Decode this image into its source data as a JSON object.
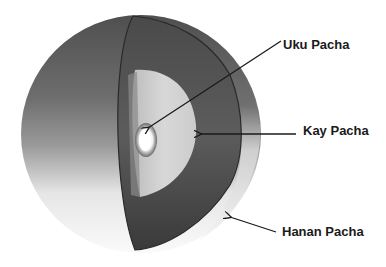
{
  "diagram": {
    "labels": [
      {
        "id": "uku",
        "text": "Uku Pacha",
        "points_to": "innermost core"
      },
      {
        "id": "kay",
        "text": "Kay Pacha",
        "points_to": "middle light layer"
      },
      {
        "id": "hanan",
        "text": "Hanan Pacha",
        "points_to": "outer sphere surface"
      }
    ]
  },
  "colors": {
    "background": "#ffffff",
    "text": "#1a1a1a",
    "arrow": "#1a1a1a",
    "outer_shell_dark": "#4a4a4a",
    "outer_shell_light": "#e8e8e8",
    "cut_face_dark": "#3c3c3c",
    "middle_layer": "#d4d4d4",
    "core": "#ffffff"
  }
}
